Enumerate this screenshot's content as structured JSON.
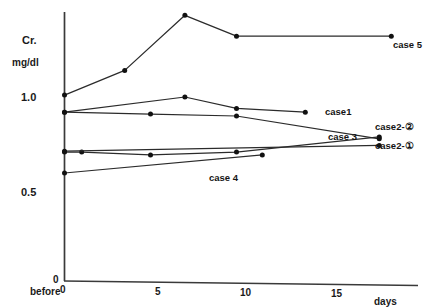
{
  "chart_data": {
    "type": "line",
    "title": "",
    "ylabel": "Cr. mg/dl",
    "xlabel": "days",
    "y_axis_title_line1": "Cr.",
    "y_axis_title_line2": "mg/dl",
    "x_axis_title": "days",
    "x_before_label": "before",
    "yticks": [
      0.5,
      1.0
    ],
    "ytick_labels": [
      "0.5",
      "1.0"
    ],
    "xticks": [
      0,
      5,
      10,
      15
    ],
    "xtick_labels": [
      "0",
      "5",
      "10",
      "15"
    ],
    "xlim": [
      -1.2,
      21
    ],
    "ylim": [
      0.0,
      1.55
    ],
    "grid": false,
    "legend_position": "inline-right-of-series",
    "origin_label": "0",
    "series": [
      {
        "name": "case 5",
        "label": "case 5",
        "x": [
          0,
          3.5,
          7,
          10,
          19
        ],
        "y": [
          1.01,
          1.14,
          1.43,
          1.32,
          1.32
        ]
      },
      {
        "name": "case 1",
        "label": "case 1",
        "x": [
          0,
          7,
          10,
          14
        ],
        "y": [
          0.92,
          1.0,
          0.94,
          0.92
        ]
      },
      {
        "name": "case 3",
        "label": "case 3",
        "x": [
          0,
          5,
          10,
          18.3
        ],
        "y": [
          0.92,
          0.91,
          0.9,
          0.78
        ]
      },
      {
        "name": "case 2-②",
        "label": "case 2-②",
        "x": [
          0,
          1,
          5,
          10,
          18.3
        ],
        "y": [
          0.71,
          0.71,
          0.695,
          0.71,
          0.79
        ]
      },
      {
        "name": "case 2-①",
        "label": "case 2-①",
        "x": [
          0,
          18.3
        ],
        "y": [
          0.715,
          0.745
        ]
      },
      {
        "name": "case 4",
        "label": "case 4",
        "x": [
          0,
          11.5
        ],
        "y": [
          0.6,
          0.695
        ]
      }
    ]
  },
  "axis": {
    "y_title_1": "Cr.",
    "y_title_2": "mg/dl",
    "y_1_0": "1.0",
    "y_0_5": "0.5",
    "origin": "0",
    "x_before": "before",
    "x_0": "0",
    "x_5": "5",
    "x_10": "10",
    "x_15": "15",
    "x_days": "days"
  },
  "labels": {
    "case5": "case 5",
    "case1": "case1",
    "case3": "case 3",
    "case2_2": "case2-②",
    "case2_1": "case2-①",
    "case4": "case 4"
  },
  "colors": {
    "line": "#2b2b2b",
    "marker": "#111111",
    "axis": "#3a3a3a",
    "text": "#141414",
    "background": "#ffffff"
  }
}
